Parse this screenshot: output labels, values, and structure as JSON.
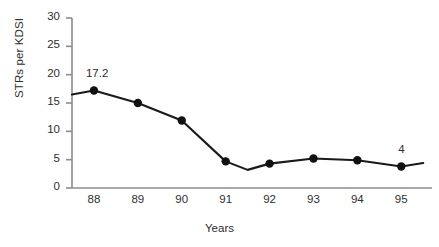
{
  "chart_data": {
    "type": "line",
    "title": "",
    "subtitle": "",
    "xlabel": "Years",
    "ylabel": "STRs per KDSI",
    "categories": [
      "88",
      "89",
      "90",
      "91",
      "92",
      "93",
      "94",
      "95"
    ],
    "x": [
      88,
      89,
      90,
      91,
      92,
      93,
      94,
      95
    ],
    "values": [
      17.2,
      15.0,
      11.9,
      4.7,
      4.3,
      5.2,
      4.9,
      3.8
    ],
    "series": [
      {
        "name": "STRs per KDSI",
        "values": [
          17.2,
          15.0,
          11.9,
          4.7,
          4.3,
          5.2,
          4.9,
          3.8
        ]
      }
    ],
    "extra_vertices": [
      {
        "x": 87.5,
        "y": 16.5,
        "marker": false,
        "note": "line start at axis"
      },
      {
        "x": 91.5,
        "y": 3.2,
        "marker": false,
        "note": "dip between 91 and 92"
      },
      {
        "x": 95.5,
        "y": 4.4,
        "marker": false,
        "note": "line end past last point"
      }
    ],
    "annotations": [
      {
        "text": "17.2",
        "x": 88,
        "y": 17.2,
        "position": "above"
      },
      {
        "text": "4",
        "x": 95,
        "y": 3.8,
        "position": "above"
      }
    ],
    "xlim": [
      87.5,
      95.7
    ],
    "ylim": [
      0,
      30
    ],
    "yticks": [
      0,
      5,
      10,
      15,
      20,
      25,
      30
    ],
    "ytick_labels": [
      "0",
      "5",
      "10",
      "15",
      "20",
      "25",
      "30"
    ],
    "xtick_labels": [
      "88",
      "89",
      "90",
      "91",
      "92",
      "93",
      "94",
      "95"
    ],
    "grid": false,
    "legend": false,
    "legend_position": "none",
    "colors": {
      "line": "#1a1a1a",
      "marker": "#111111",
      "axis": "#8c8c8c",
      "text": "#2e2e2e",
      "background": "#ffffff"
    }
  }
}
